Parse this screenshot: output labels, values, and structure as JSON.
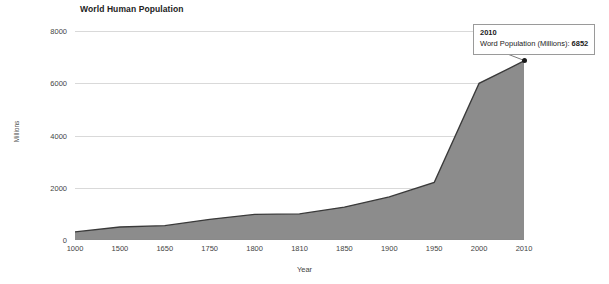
{
  "chart_data": {
    "type": "area",
    "title": "World Human Population",
    "xlabel": "Year",
    "ylabel": "Millions",
    "categories": [
      "1000",
      "1500",
      "1650",
      "1750",
      "1800",
      "1810",
      "1850",
      "1900",
      "1950",
      "2000",
      "2010"
    ],
    "values": [
      310,
      500,
      550,
      790,
      980,
      1000,
      1260,
      1650,
      2200,
      6000,
      6852
    ],
    "series": [
      {
        "name": "Word Population (Millions)",
        "values": [
          310,
          500,
          550,
          790,
          980,
          1000,
          1260,
          1650,
          2200,
          6000,
          6852
        ]
      }
    ],
    "ylim": [
      0,
      8000
    ],
    "yticks": [
      "0",
      "2000",
      "4000",
      "6000",
      "8000"
    ],
    "ytick_values": [
      0,
      2000,
      4000,
      6000,
      8000
    ],
    "grid": true,
    "legend": "none",
    "area_color": "#8c8c8c",
    "line_color": "#3a3a3a",
    "grid_color": "#d9d9d9"
  },
  "tooltip": {
    "year": "2010",
    "label": "Word Population (Millions):",
    "value": "6852",
    "marker_point": {
      "x": "2010",
      "y": 6852
    }
  }
}
